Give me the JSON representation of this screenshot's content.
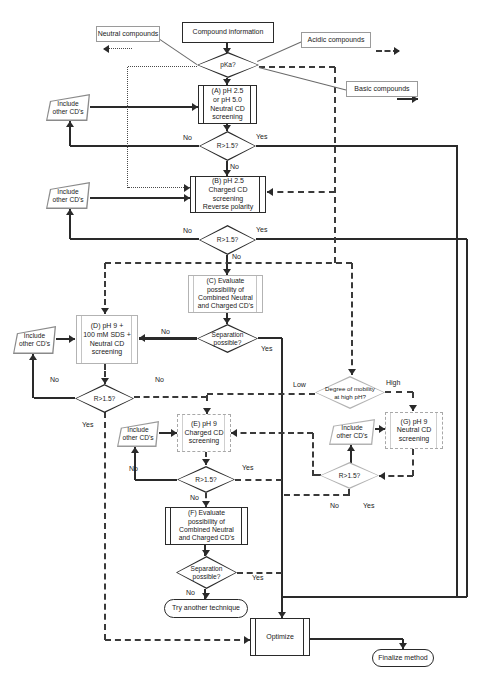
{
  "diagram": {
    "nodes": {
      "compound_info": "Compound information",
      "neutral": "Neutral compounds",
      "acidic": "Acidic compounds",
      "basic": "Basic compounds",
      "pka": "pKa?",
      "screen_a": "(A) pH 2.5\nor pH 5.0\nNeutral CD\nscreening",
      "include_cds": "Include\nother CD's",
      "r15": "R>1.5?",
      "screen_b": "(B) pH 2.5\nCharged CD\nscreening\nReverse polarity",
      "eval_c": "(C) Evaluate\npossibility of\nCombined Neutral\nand Charged CD's",
      "sep_possible": "Separation\npossible?",
      "screen_d": "(D) pH 9 +\n100 mM SDS +\nNeutral CD\nscreening",
      "mobility": "Degree of mobility\nat high pH?",
      "screen_e": "(E) pH 9\nCharged CD\nscreening",
      "screen_g": "(G) pH 9\nNeutral CD\nscreening",
      "eval_f": "(F) Evaluate\npossibility of\nCombined Neutral\nand Charged CD's",
      "try_another": "Try another technique",
      "optimize": "Optimize",
      "finalize": "Finalize method"
    },
    "edge_labels": {
      "yes": "Yes",
      "no": "No",
      "low": "Low",
      "high": "High"
    }
  }
}
